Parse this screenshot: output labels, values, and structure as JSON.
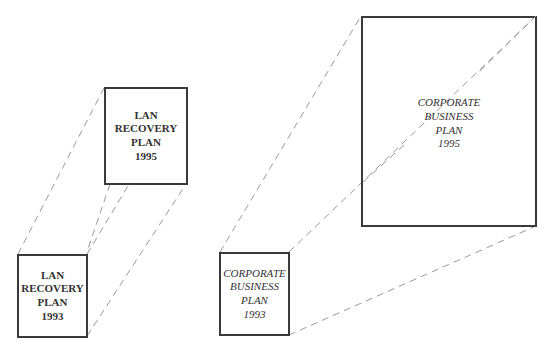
{
  "diagram": {
    "groups": [
      {
        "name": "lan-recovery-plan",
        "boxes": [
          {
            "id": "lan-1993",
            "lines": [
              "LAN",
              "RECOVERY",
              "PLAN",
              "1993"
            ]
          },
          {
            "id": "lan-1995",
            "lines": [
              "LAN",
              "RECOVERY",
              "PLAN",
              "1995"
            ]
          }
        ]
      },
      {
        "name": "corporate-business-plan",
        "boxes": [
          {
            "id": "cbp-1993",
            "lines": [
              "CORPORATE",
              "BUSINESS",
              "PLAN",
              "1993"
            ]
          },
          {
            "id": "cbp-1995",
            "lines": [
              "CORPORATE",
              "BUSINESS",
              "PLAN",
              "1995"
            ]
          }
        ]
      }
    ],
    "colors": {
      "box_border": "#3a3a3a",
      "connector": "#9a9a9a",
      "text": "#333333",
      "background": "#ffffff"
    }
  }
}
